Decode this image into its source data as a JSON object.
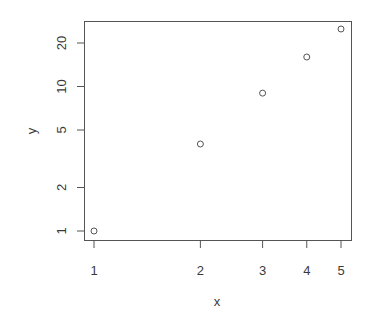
{
  "chart_data": {
    "type": "scatter",
    "title": "",
    "xlabel": "x",
    "ylabel": "y",
    "x_scale": "log",
    "y_scale": "log",
    "x": [
      1,
      2,
      3,
      4,
      5
    ],
    "y": [
      1,
      4,
      9,
      16,
      25
    ],
    "xlim": [
      0.97,
      5.2
    ],
    "ylim": [
      0.95,
      27
    ],
    "x_ticks": [
      1,
      2,
      3,
      4,
      5
    ],
    "x_tick_labels": [
      "1",
      "2",
      "3",
      "4",
      "5"
    ],
    "y_ticks": [
      1,
      2,
      5,
      10,
      20
    ],
    "y_tick_labels": [
      "1",
      "2",
      "5",
      "10",
      "20"
    ],
    "grid": false,
    "legend": null,
    "marker": "open-circle",
    "colors": {
      "axis": "#555555",
      "marker": "#555555",
      "text": "#3a3a3a",
      "background": "#ffffff"
    }
  }
}
